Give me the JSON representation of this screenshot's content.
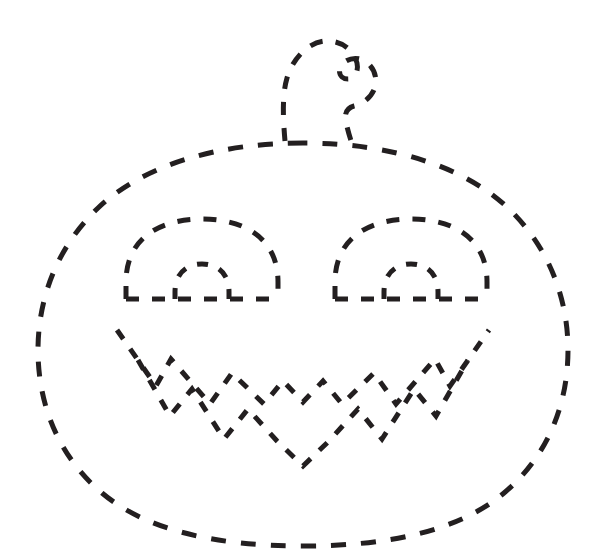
{
  "document": {
    "kind": "tracing-worksheet",
    "subject": "jack-o-lantern",
    "title": "Pumpkin Tracing Worksheet",
    "canvas": {
      "width": 607,
      "height": 558,
      "background": "#ffffff"
    }
  },
  "style": {
    "stroke_color": "#231f20",
    "background_color": "#ffffff",
    "stroke_width": 5,
    "dash_pattern": "14 14",
    "dash_pattern_short": "10 11",
    "dash_pattern_fine": "9 10",
    "line_cap": "butt"
  },
  "figure": {
    "name": "jack-o-lantern",
    "parts": [
      {
        "id": "pumpkin-body",
        "label": "Pumpkin body outline",
        "dash": "15 15",
        "width": 5,
        "d": "M 303 143 C 212 143 140 168 98 208 C 56 248 38 300 38 350 C 38 404 58 456 102 493 C 146 530 215 546 303 546 C 391 546 460 530 504 493 C 548 456 568 404 568 350 C 568 300 550 248 508 208 C 466 168 394 143 303 143 Z"
      },
      {
        "id": "pumpkin-stem",
        "label": "Pumpkin stem",
        "dash": "13 13",
        "width": 5,
        "d": "M 285 141 C 283 118 282 95 287 78 C 292 60 308 41 327 41 C 343 41 354 51 357 63 C 359 72 354 79 348 79 C 342 79 338 74 340 68 C 343 60 354 56 363 60 C 373 65 378 77 375 87 C 372 97 363 104 354 106 C 347 108 344 113 346 122 C 348 132 351 141 354 149"
      },
      {
        "id": "eye-left-dome",
        "label": "Left eye outer dome",
        "dash": "13 13",
        "width": 5,
        "d": "M 126 299 L 126 282 C 126 238 160 219 202 219 C 244 219 278 238 278 282 L 278 299"
      },
      {
        "id": "eye-left-baseline",
        "label": "Left eye baseline",
        "dash": "13 13",
        "width": 5,
        "d": "M 126 299 L 278 299"
      },
      {
        "id": "eye-left-inner-arch",
        "label": "Left eye inner arch",
        "dash": "11 12",
        "width": 5,
        "d": "M 175 299 L 175 292 C 175 273 187 264 202 264 C 217 264 229 273 229 292 L 229 299"
      },
      {
        "id": "eye-right-dome",
        "label": "Right eye outer dome",
        "dash": "13 13",
        "width": 5,
        "d": "M 335 299 L 335 282 C 335 238 369 219 411 219 C 453 219 487 238 487 282 L 487 299"
      },
      {
        "id": "eye-right-baseline",
        "label": "Right eye baseline",
        "dash": "13 13",
        "width": 5,
        "d": "M 335 299 L 487 299"
      },
      {
        "id": "eye-right-inner-arch",
        "label": "Right eye inner arch",
        "dash": "11 12",
        "width": 5,
        "d": "M 384 299 L 384 292 C 384 273 396 264 411 264 C 426 264 438 273 438 292 L 438 299"
      },
      {
        "id": "mouth-upper-zigzag",
        "label": "Mouth upper jagged lip",
        "dash": "11 12",
        "width": 5,
        "d": "M 117 330 L 156 386 L 171 359 L 210 404 L 232 373 L 264 404 L 283 381 L 303 402 L 323 381 L 342 404 L 374 373 L 396 404 L 435 359 L 450 386 L 489 330"
      },
      {
        "id": "mouth-lower-zigzag",
        "label": "Mouth lower jagged lip",
        "dash": "11 12",
        "width": 5,
        "d": "M 138 360 L 170 416 L 192 389 L 224 439 L 248 409 L 277 441 L 303 466 L 329 441 L 358 409 L 382 439 L 414 389 L 436 416 L 468 360"
      }
    ]
  }
}
